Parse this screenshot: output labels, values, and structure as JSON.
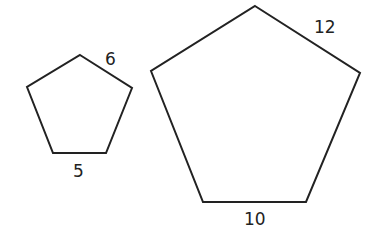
{
  "diagram": {
    "stroke_color": "#222222",
    "background": "#ffffff",
    "shapes": [
      {
        "name": "small-pentagon",
        "points": "80,55 132,88 106,153 53,153 27,87",
        "labels": {
          "slant_side": "6",
          "bottom_side": "5"
        }
      },
      {
        "name": "large-pentagon",
        "points": "255,6 360,73 306,202 203,202 151,71",
        "labels": {
          "slant_side": "12",
          "bottom_side": "10"
        }
      }
    ]
  }
}
